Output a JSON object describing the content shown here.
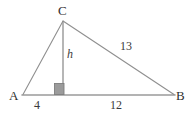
{
  "figure": {
    "kind": "geometry-diagram",
    "background_color": "#ffffff",
    "stroke_color": "#8a8a8a",
    "base_stroke_color": "#9a9a9a",
    "text_color": "#2f2f2f",
    "right_angle_fill": "#9b9b9b",
    "right_angle_stroke": "#7d7d7d"
  },
  "vertices": {
    "C": {
      "label": "C",
      "x": 63,
      "y": 20
    },
    "A": {
      "label": "A",
      "x": 22,
      "y": 95
    },
    "B": {
      "label": "B",
      "x": 175,
      "y": 95
    },
    "foot": {
      "label": "",
      "x": 63,
      "y": 95
    }
  },
  "segments": {
    "base_left": {
      "name": "A-to-foot",
      "length_label": "4"
    },
    "base_right": {
      "name": "foot-to-B",
      "length_label": "12"
    },
    "hypotenuse": {
      "name": "C-to-B",
      "length_label": "13"
    },
    "altitude": {
      "name": "C-to-foot",
      "length_label": "h"
    },
    "left_side": {
      "name": "A-to-C",
      "length_label": ""
    }
  },
  "labels": {
    "vertex_c": "C",
    "vertex_a": "A",
    "vertex_b": "B",
    "segment_4": "4",
    "segment_12": "12",
    "segment_13": "13",
    "height": "h"
  },
  "markers": {
    "right_angle": {
      "name": "right-angle-square",
      "x": 55,
      "y": 84,
      "width": 10,
      "height": 11
    }
  }
}
